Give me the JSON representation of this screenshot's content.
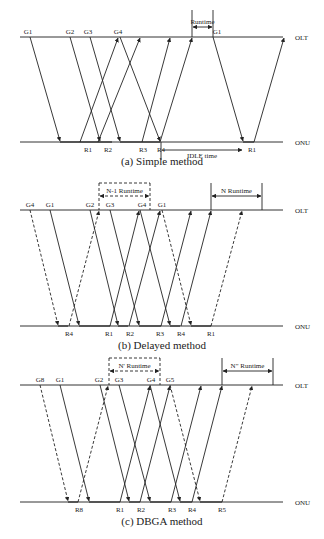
{
  "figure": {
    "olt_label": "OLT",
    "onu_label": "ONU",
    "panels": [
      {
        "id": "a",
        "caption": "(a) Simple method",
        "olt_y": 37,
        "onu_y": 142,
        "x0": 20,
        "x1": 283,
        "grant_labels": [
          {
            "text": "G1",
            "x": 28
          },
          {
            "text": "G2",
            "x": 70
          },
          {
            "text": "G3",
            "x": 88
          },
          {
            "text": "G4",
            "x": 118
          },
          {
            "text": "G1",
            "x": 217
          }
        ],
        "report_labels": [
          {
            "text": "R1",
            "x": 88
          },
          {
            "text": "R2",
            "x": 108
          },
          {
            "text": "R3",
            "x": 143
          },
          {
            "text": "R4",
            "x": 161
          },
          {
            "text": "R1",
            "x": 252
          }
        ],
        "down": [
          {
            "x1": 30,
            "x2": 60,
            "dashed": false
          },
          {
            "x1": 70,
            "x2": 100,
            "dashed": false
          },
          {
            "x1": 90,
            "x2": 120,
            "dashed": false
          },
          {
            "x1": 120,
            "x2": 160,
            "dashed": false
          },
          {
            "x1": 213,
            "x2": 243,
            "dashed": false
          }
        ],
        "up": [
          {
            "x1": 80,
            "x2": 118,
            "dashed": false
          },
          {
            "x1": 98,
            "x2": 140,
            "dashed": false
          },
          {
            "x1": 142,
            "x2": 170,
            "dashed": false
          },
          {
            "x1": 160,
            "x2": 192,
            "dashed": false
          },
          {
            "x1": 254,
            "x2": 284,
            "dashed": false
          }
        ],
        "busy": [
          [
            60,
            100
          ],
          [
            100,
            112
          ],
          [
            120,
            160
          ],
          [
            243,
            254
          ]
        ],
        "runtime": {
          "label": "Runtime",
          "x1": 192,
          "x2": 213,
          "y": 27,
          "top": 10
        },
        "idle": {
          "label": "IDLE time",
          "x1": 161,
          "x2": 243,
          "y": 154
        }
      },
      {
        "id": "b",
        "caption": "(b) Delayed method",
        "olt_y": 210,
        "onu_y": 326,
        "x0": 20,
        "x1": 283,
        "grant_labels": [
          {
            "text": "G4",
            "x": 30
          },
          {
            "text": "G1",
            "x": 50
          },
          {
            "text": "G2",
            "x": 90
          },
          {
            "text": "G3",
            "x": 110
          },
          {
            "text": "G4",
            "x": 142
          },
          {
            "text": "G1",
            "x": 162
          }
        ],
        "report_labels": [
          {
            "text": "R4",
            "x": 69
          },
          {
            "text": "R1",
            "x": 109
          },
          {
            "text": "R2",
            "x": 130
          },
          {
            "text": "R3",
            "x": 160
          },
          {
            "text": "R4",
            "x": 181
          },
          {
            "text": "R1",
            "x": 211
          }
        ],
        "down": [
          {
            "x1": 30,
            "x2": 58,
            "dashed": true
          },
          {
            "x1": 50,
            "x2": 79,
            "dashed": false
          },
          {
            "x1": 90,
            "x2": 118,
            "dashed": false
          },
          {
            "x1": 110,
            "x2": 139,
            "dashed": false
          },
          {
            "x1": 140,
            "x2": 170,
            "dashed": false
          },
          {
            "x1": 162,
            "x2": 191,
            "dashed": true
          }
        ],
        "up": [
          {
            "x1": 69,
            "x2": 99,
            "dashed": true
          },
          {
            "x1": 110,
            "x2": 139,
            "dashed": false
          },
          {
            "x1": 129,
            "x2": 160,
            "dashed": false
          },
          {
            "x1": 161,
            "x2": 191,
            "dashed": false
          },
          {
            "x1": 181,
            "x2": 211,
            "dashed": false
          },
          {
            "x1": 211,
            "x2": 242,
            "dashed": true
          }
        ],
        "busy": [
          [
            58,
            68
          ],
          [
            79,
            110
          ],
          [
            118,
            128
          ],
          [
            139,
            161
          ],
          [
            170,
            180
          ],
          [
            191,
            211
          ]
        ],
        "runtime": {
          "label": "N-1 Runtime",
          "x1": 99,
          "x2": 150,
          "y": 196,
          "top": 183,
          "dashed": true
        },
        "runtime2": {
          "label": "N Runtime",
          "x1": 211,
          "x2": 262,
          "y": 196,
          "top": 183,
          "dashed": false
        }
      },
      {
        "id": "c",
        "caption": "(c) DBGA method",
        "olt_y": 385,
        "onu_y": 502,
        "x0": 20,
        "x1": 283,
        "grant_labels": [
          {
            "text": "G8",
            "x": 40
          },
          {
            "text": "G1",
            "x": 60
          },
          {
            "text": "G2",
            "x": 99
          },
          {
            "text": "G3",
            "x": 119
          },
          {
            "text": "G4",
            "x": 151
          },
          {
            "text": "G5",
            "x": 170
          }
        ],
        "report_labels": [
          {
            "text": "R8",
            "x": 79
          },
          {
            "text": "R1",
            "x": 120
          },
          {
            "text": "R2",
            "x": 141
          },
          {
            "text": "R3",
            "x": 172
          },
          {
            "text": "R4",
            "x": 192
          },
          {
            "text": "R5",
            "x": 222
          }
        ],
        "down": [
          {
            "x1": 40,
            "x2": 68,
            "dashed": true
          },
          {
            "x1": 60,
            "x2": 89,
            "dashed": false
          },
          {
            "x1": 100,
            "x2": 129,
            "dashed": false
          },
          {
            "x1": 119,
            "x2": 150,
            "dashed": false
          },
          {
            "x1": 150,
            "x2": 180,
            "dashed": false
          },
          {
            "x1": 170,
            "x2": 200,
            "dashed": true
          }
        ],
        "up": [
          {
            "x1": 78,
            "x2": 108,
            "dashed": true
          },
          {
            "x1": 120,
            "x2": 150,
            "dashed": false
          },
          {
            "x1": 140,
            "x2": 170,
            "dashed": false
          },
          {
            "x1": 171,
            "x2": 201,
            "dashed": false
          },
          {
            "x1": 192,
            "x2": 222,
            "dashed": false
          },
          {
            "x1": 222,
            "x2": 252,
            "dashed": true
          }
        ],
        "busy": [
          [
            68,
            78
          ],
          [
            89,
            120
          ],
          [
            129,
            140
          ],
          [
            150,
            171
          ],
          [
            180,
            192
          ],
          [
            200,
            222
          ]
        ],
        "runtime": {
          "label": "N' Runtime",
          "x1": 109,
          "x2": 160,
          "y": 371,
          "top": 358,
          "dashed": true
        },
        "runtime2": {
          "label": "N\" Runtime",
          "x1": 222,
          "x2": 273,
          "y": 371,
          "top": 358,
          "dashed": false
        }
      }
    ]
  }
}
